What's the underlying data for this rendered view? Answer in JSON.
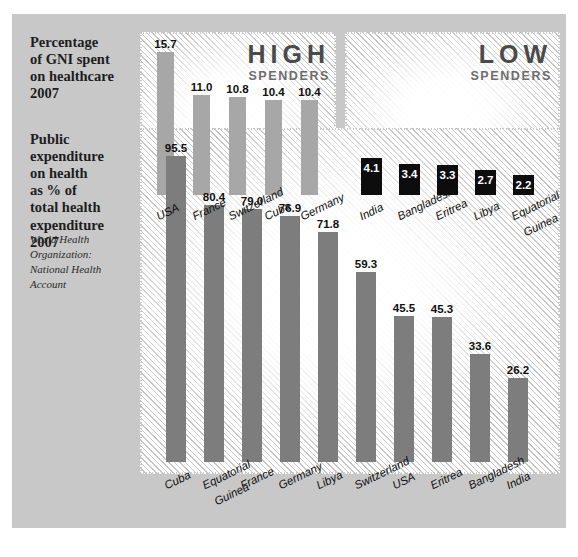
{
  "page": {
    "background_color": "#c8c8c8"
  },
  "top_section": {
    "caption": "Percentage of GNI spent on healthcare 2007",
    "caption_lines": [
      "Percentage",
      "of GNI spent",
      "on healthcare",
      "2007"
    ],
    "panels": [
      {
        "heading_big": "HIGH",
        "heading_sub": "SPENDERS"
      },
      {
        "heading_big": "LOW",
        "heading_sub": "SPENDERS"
      }
    ]
  },
  "bottom_section": {
    "caption": "Public expenditure on health as % of total health expenditure 2007",
    "caption_lines": [
      "Public",
      "expenditure",
      "on health",
      "as % of",
      "total health",
      "expenditure",
      "2007"
    ],
    "attribution_lines": [
      "World Health",
      "Organization:",
      "National Health",
      "Account"
    ]
  },
  "chart_data": [
    {
      "type": "bar",
      "title": "Percentage of GNI spent on healthcare 2007",
      "group": "HIGH SPENDERS",
      "xlabel": "",
      "ylabel": "Percentage of GNI",
      "ylim": [
        0,
        16.5
      ],
      "grid": false,
      "legend": "none",
      "bar_color": "#a7a7a7",
      "label_color": "#101010",
      "categories": [
        "USA",
        "France",
        "Switzerland",
        "Cuba",
        "Germany"
      ],
      "category_label_lines": [
        [
          "USA"
        ],
        [
          "France"
        ],
        [
          "Switzerland"
        ],
        [
          "Cuba"
        ],
        [
          "Germany"
        ]
      ],
      "values": [
        15.7,
        11.0,
        10.8,
        10.4,
        10.4
      ],
      "value_labels": [
        "15.7",
        "11.0",
        "10.8",
        "10.4",
        "10.4"
      ]
    },
    {
      "type": "bar",
      "title": "Percentage of GNI spent on healthcare 2007",
      "group": "LOW SPENDERS",
      "xlabel": "",
      "ylabel": "Percentage of GNI",
      "ylim": [
        0,
        16.5
      ],
      "grid": false,
      "legend": "none",
      "bar_color": "#0d0d0d",
      "label_color": "#ffffff",
      "categories": [
        "India",
        "Bangladesh",
        "Eritrea",
        "Libya",
        "Equatorial Guinea"
      ],
      "category_label_lines": [
        [
          "India"
        ],
        [
          "Bangladesh"
        ],
        [
          "Eritrea"
        ],
        [
          "Libya"
        ],
        [
          "Equatorial",
          "Guinea"
        ]
      ],
      "values": [
        4.1,
        3.4,
        3.3,
        2.7,
        2.2
      ],
      "value_labels": [
        "4.1",
        "3.4",
        "3.3",
        "2.7",
        "2.2"
      ]
    },
    {
      "type": "bar",
      "title": "Public expenditure on health as % of total health expenditure 2007",
      "group": "",
      "xlabel": "",
      "ylabel": "Public expenditure on health as % of total health expenditure",
      "ylim": [
        0,
        100
      ],
      "grid": false,
      "legend": "none",
      "bar_color": "#7d7d7d",
      "label_color": "#101010",
      "source": "World Health Organization: National Health Account",
      "categories": [
        "Cuba",
        "Equatorial Guinea",
        "France",
        "Germany",
        "Libya",
        "Switzerland",
        "USA",
        "Eritrea",
        "Bangladesh",
        "India"
      ],
      "category_label_lines": [
        [
          "Cuba"
        ],
        [
          "Equatorial",
          "Guinea"
        ],
        [
          "France"
        ],
        [
          "Germany"
        ],
        [
          "Libya"
        ],
        [
          "Switzerland"
        ],
        [
          "USA"
        ],
        [
          "Eritrea"
        ],
        [
          "Bangladesh"
        ],
        [
          "India"
        ]
      ],
      "values": [
        95.5,
        80.4,
        79.0,
        76.9,
        71.8,
        59.3,
        45.5,
        45.3,
        33.6,
        26.2
      ],
      "value_labels": [
        "95.5",
        "80.4",
        "79.0",
        "76.9",
        "71.8",
        "59.3",
        "45.5",
        "45.3",
        "33.6",
        "26.2"
      ]
    }
  ]
}
